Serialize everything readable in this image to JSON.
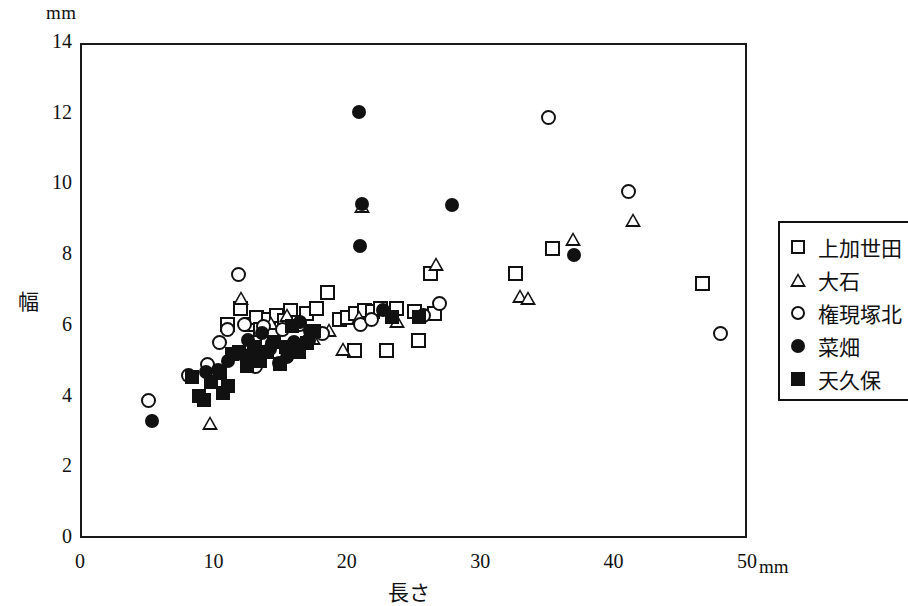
{
  "chart_data": {
    "type": "scatter",
    "title": "",
    "xlabel": "長さ",
    "ylabel": "幅",
    "x_unit": "mm",
    "y_unit": "mm",
    "xlim": [
      0,
      50
    ],
    "ylim": [
      0,
      14
    ],
    "xticks": [
      0,
      10,
      20,
      30,
      40,
      50
    ],
    "yticks": [
      0,
      2,
      4,
      6,
      8,
      10,
      12,
      14
    ],
    "grid": false,
    "legend_position": "right",
    "series": [
      {
        "name": "上加世田",
        "marker": "square-open",
        "points": [
          [
            11.9,
            6.55
          ],
          [
            12.6,
            6.1
          ],
          [
            13.1,
            6.3
          ],
          [
            13.4,
            5.95
          ],
          [
            14.0,
            6.25
          ],
          [
            14.6,
            6.35
          ],
          [
            15.2,
            6.2
          ],
          [
            15.6,
            6.5
          ],
          [
            16.2,
            6.15
          ],
          [
            16.8,
            6.4
          ],
          [
            17.6,
            6.55
          ],
          [
            18.4,
            7.0
          ],
          [
            19.3,
            6.25
          ],
          [
            19.9,
            6.3
          ],
          [
            20.5,
            6.4
          ],
          [
            21.2,
            6.5
          ],
          [
            21.8,
            6.45
          ],
          [
            22.4,
            6.55
          ],
          [
            20.4,
            5.35
          ],
          [
            22.8,
            5.35
          ],
          [
            25.2,
            5.65
          ],
          [
            26.1,
            7.55
          ],
          [
            24.9,
            6.45
          ],
          [
            26.4,
            6.4
          ],
          [
            32.5,
            7.55
          ],
          [
            35.3,
            8.25
          ],
          [
            46.5,
            7.25
          ],
          [
            13.9,
            5.6
          ],
          [
            10.9,
            6.1
          ],
          [
            23.6,
            6.55
          ]
        ]
      },
      {
        "name": "大石",
        "marker": "triangle-open",
        "points": [
          [
            9.6,
            3.3
          ],
          [
            11.9,
            6.85
          ],
          [
            15.4,
            6.35
          ],
          [
            17.3,
            5.7
          ],
          [
            19.6,
            5.4
          ],
          [
            20.8,
            6.3
          ],
          [
            21.0,
            9.45
          ],
          [
            23.6,
            6.2
          ],
          [
            26.5,
            7.8
          ],
          [
            32.8,
            6.9
          ],
          [
            33.4,
            6.85
          ],
          [
            36.8,
            8.5
          ],
          [
            41.3,
            9.05
          ],
          [
            14.2,
            6.15
          ],
          [
            18.5,
            5.95
          ]
        ]
      },
      {
        "name": "権現塚北",
        "marker": "circle-open",
        "points": [
          [
            5.0,
            3.95
          ],
          [
            8.0,
            4.65
          ],
          [
            10.3,
            5.6
          ],
          [
            10.9,
            5.95
          ],
          [
            11.7,
            7.5
          ],
          [
            12.2,
            6.1
          ],
          [
            12.9,
            5.35
          ],
          [
            13.6,
            6.05
          ],
          [
            14.3,
            5.55
          ],
          [
            15.0,
            5.95
          ],
          [
            15.7,
            5.35
          ],
          [
            16.3,
            6.1
          ],
          [
            17.0,
            5.65
          ],
          [
            18.0,
            5.85
          ],
          [
            20.9,
            6.1
          ],
          [
            21.7,
            6.25
          ],
          [
            25.6,
            6.35
          ],
          [
            26.8,
            6.7
          ],
          [
            35.0,
            11.95
          ],
          [
            41.0,
            9.85
          ],
          [
            47.9,
            5.85
          ],
          [
            9.4,
            4.95
          ],
          [
            13.0,
            4.9
          ]
        ]
      },
      {
        "name": "菜畑",
        "marker": "circle-filled",
        "points": [
          [
            5.3,
            3.35
          ],
          [
            9.3,
            4.75
          ],
          [
            11.0,
            5.05
          ],
          [
            12.0,
            5.25
          ],
          [
            12.8,
            5.1
          ],
          [
            13.5,
            5.85
          ],
          [
            14.1,
            5.4
          ],
          [
            14.8,
            5.0
          ],
          [
            15.4,
            5.15
          ],
          [
            15.9,
            5.6
          ],
          [
            16.4,
            6.15
          ],
          [
            17.1,
            5.9
          ],
          [
            20.8,
            12.1
          ],
          [
            21.0,
            9.5
          ],
          [
            20.9,
            8.3
          ],
          [
            22.6,
            6.5
          ],
          [
            27.8,
            9.45
          ],
          [
            36.9,
            8.05
          ],
          [
            12.5,
            5.65
          ],
          [
            10.2,
            4.8
          ]
        ]
      },
      {
        "name": "天久保",
        "marker": "square-filled",
        "points": [
          [
            8.3,
            4.6
          ],
          [
            8.8,
            4.05
          ],
          [
            9.2,
            3.95
          ],
          [
            9.7,
            4.45
          ],
          [
            10.4,
            4.7
          ],
          [
            11.3,
            5.25
          ],
          [
            11.8,
            5.3
          ],
          [
            12.4,
            4.9
          ],
          [
            12.9,
            5.45
          ],
          [
            13.4,
            5.05
          ],
          [
            13.9,
            5.3
          ],
          [
            14.4,
            5.6
          ],
          [
            14.9,
            4.95
          ],
          [
            15.3,
            5.45
          ],
          [
            15.8,
            6.05
          ],
          [
            16.3,
            5.3
          ],
          [
            16.9,
            5.55
          ],
          [
            17.4,
            5.9
          ],
          [
            23.3,
            6.3
          ],
          [
            25.3,
            6.3
          ],
          [
            11.0,
            4.35
          ],
          [
            10.6,
            4.15
          ]
        ]
      }
    ]
  },
  "axes": {
    "y_unit_label": "mm",
    "x_unit_label": "mm",
    "y_title": "幅",
    "x_title": "長さ",
    "ytick_labels": [
      "0",
      "2",
      "4",
      "6",
      "8",
      "10",
      "12",
      "14"
    ],
    "xtick_labels": [
      "0",
      "10",
      "20",
      "30",
      "40",
      "50"
    ]
  },
  "legend": {
    "items": [
      {
        "label": "上加世田",
        "marker": "square-open",
        "icon": "square-open-icon"
      },
      {
        "label": "大石",
        "marker": "triangle-open",
        "icon": "triangle-open-icon"
      },
      {
        "label": "権現塚北",
        "marker": "circle-open",
        "icon": "circle-open-icon"
      },
      {
        "label": "菜畑",
        "marker": "circle-filled",
        "icon": "circle-filled-icon"
      },
      {
        "label": "天久保",
        "marker": "square-filled",
        "icon": "square-filled-icon"
      }
    ]
  },
  "colors": {
    "ink": "#111111",
    "background": "#ffffff"
  }
}
